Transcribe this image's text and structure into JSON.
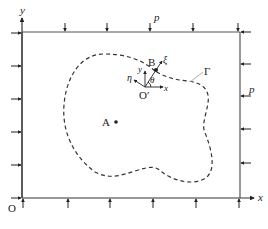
{
  "figure": {
    "labels": {
      "y_axis": "y",
      "x_axis": "x",
      "origin": "O",
      "pressure_top": "p",
      "pressure_right": "p",
      "boundary": "Γ",
      "point_a": "A",
      "point_b": "B",
      "local_origin": "O′",
      "local_x": "x",
      "local_y": "y",
      "xi": "ξ",
      "eta": "η",
      "theta": "θ"
    },
    "load_arrows": {
      "top_count": 6,
      "bottom_count": 6,
      "left_count": 6,
      "right_count": 6
    },
    "colors": {
      "line": "#3a3a3a",
      "background": "#ffffff"
    }
  }
}
